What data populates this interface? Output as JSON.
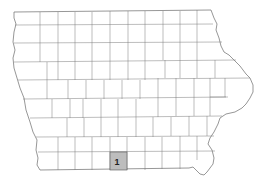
{
  "map": {
    "region": "Iowa",
    "type": "county outline map",
    "highlight_color": "#bdbdbd",
    "highlighted_counties": [
      {
        "label": "1",
        "x": 110,
        "y": 152,
        "w": 17,
        "h": 18
      }
    ]
  }
}
